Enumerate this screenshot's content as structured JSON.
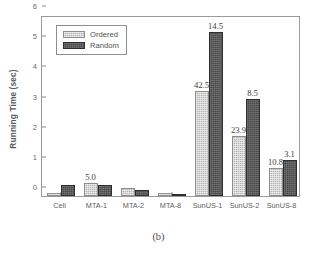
{
  "figure": {
    "caption": "(b)"
  },
  "chart_data": {
    "type": "bar",
    "title": "",
    "xlabel": "",
    "ylabel": "Running Time (sec)",
    "ylim": [
      0,
      6
    ],
    "yticks": [
      "0",
      "1",
      "2",
      "3",
      "4",
      "5",
      "6"
    ],
    "grid": false,
    "legend_position": "top-left",
    "categories": [
      "Cell",
      "MTA-1",
      "MTA-2",
      "MTA-8",
      "SunUS-1",
      "SunUS-2",
      "SunUS-8"
    ],
    "series": [
      {
        "name": "Ordered",
        "color": "#b5b5b5",
        "values": [
          0.09,
          0.42,
          0.25,
          0.11,
          3.47,
          2.0,
          0.92
        ],
        "annotations": [
          "",
          "5.0",
          "",
          "",
          "42.5",
          "23.9",
          "10.8"
        ]
      },
      {
        "name": "Random",
        "color": "#4a4a4a",
        "values": [
          0.37,
          0.38,
          0.21,
          0.07,
          5.45,
          3.23,
          1.18
        ],
        "annotations": [
          "",
          "",
          "",
          "",
          "14.5",
          "8.5",
          "3.1"
        ]
      }
    ]
  }
}
